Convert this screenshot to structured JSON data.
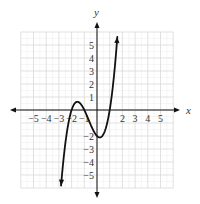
{
  "chart_data": {
    "type": "line",
    "title": "",
    "xlabel": "x",
    "ylabel": "y",
    "xlim": [
      -6,
      6
    ],
    "ylim": [
      -6,
      6
    ],
    "grid": true,
    "minor_grid": true,
    "legend": null,
    "x_ticks": [
      -5,
      -4,
      -3,
      -2,
      -1,
      2,
      3,
      4,
      5
    ],
    "y_ticks": [
      5,
      4,
      3,
      2,
      1,
      -2,
      -3,
      -4,
      -5
    ],
    "x_tick_labels": [
      "−5",
      "−4",
      "−3",
      "−2",
      "−1",
      "2",
      "3",
      "4",
      "5"
    ],
    "y_tick_labels": [
      "5",
      "4",
      "3",
      "2",
      "1",
      "−2",
      "−3",
      "−4",
      "−5"
    ],
    "series": [
      {
        "name": "f(x)",
        "expression": "(x+2)(x+1)(x-1)",
        "domain": [
          -2.83,
          1.6
        ],
        "arrows": "both",
        "color": "#111111",
        "key_points": [
          {
            "x": -2,
            "y": 0,
            "note": "x-intercept"
          },
          {
            "x": -1.5,
            "y": 0.63,
            "note": "local max"
          },
          {
            "x": -1,
            "y": 0,
            "note": "x-intercept"
          },
          {
            "x": 0,
            "y": -2,
            "note": "y-intercept"
          },
          {
            "x": 0.2,
            "y": -2.11,
            "note": "local min"
          },
          {
            "x": 1,
            "y": 0,
            "note": "x-intercept"
          }
        ]
      }
    ]
  },
  "colors": {
    "axis": "#111111",
    "curve": "#111111",
    "grid_major": "#d9d9d9",
    "grid_minor": "#ededed",
    "labels": "#333333"
  },
  "layout": {
    "origin_px": [
      97,
      110
    ],
    "unit_px_x": 12.7,
    "unit_px_y": 13
  }
}
